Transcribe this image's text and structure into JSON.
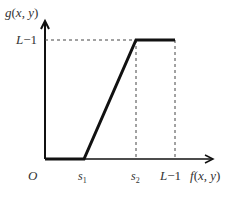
{
  "diagram": {
    "type": "piecewise-linear-transform",
    "y_axis_label": "g(x, y)",
    "x_axis_label": "f(x, y)",
    "origin_label": "O",
    "y_tick_label": "L−1",
    "x_ticks": [
      {
        "label": "s",
        "sub": "1"
      },
      {
        "label": "s",
        "sub": "2"
      },
      {
        "label": "L−1",
        "sub": ""
      }
    ],
    "segments": [
      {
        "from": "O",
        "to": "s1",
        "value": "0"
      },
      {
        "from": "s1",
        "to": "s2",
        "value": "linear ramp 0 → L−1"
      },
      {
        "from": "s2",
        "to": "L−1",
        "value": "L−1"
      }
    ],
    "colors": {
      "line": "#111111",
      "text": "#333333",
      "dashed": "#444444"
    }
  }
}
